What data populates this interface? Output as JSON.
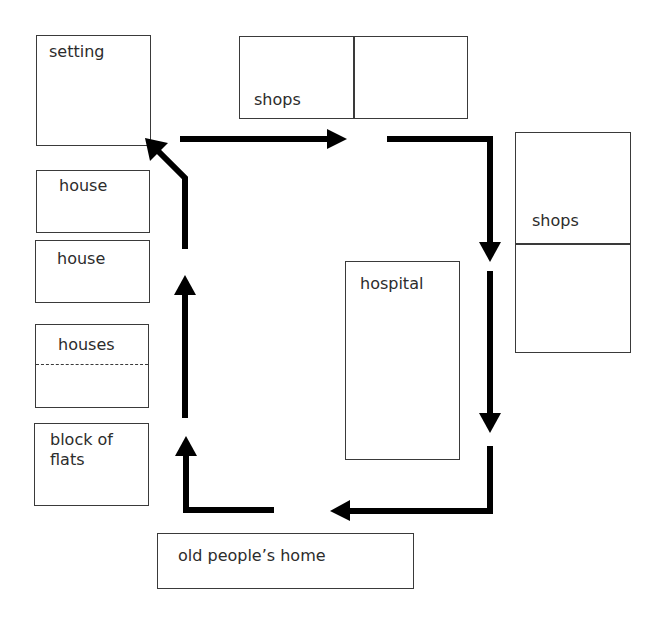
{
  "diagram": {
    "type": "route map",
    "buildings": {
      "setting": "setting",
      "shops_top": "shops",
      "shops_right": "shops",
      "hospital": "hospital",
      "house_1": "house",
      "house_2": "house",
      "houses": "houses",
      "block_of_flats": "block of flats",
      "old_peoples_home": "old people’s home"
    },
    "route": {
      "direction": "clockwise",
      "color": "#000000",
      "path_order": [
        "setting",
        "shops",
        "shops",
        "hospital",
        "old people’s home",
        "block of flats",
        "houses",
        "house",
        "house",
        "setting"
      ]
    }
  }
}
